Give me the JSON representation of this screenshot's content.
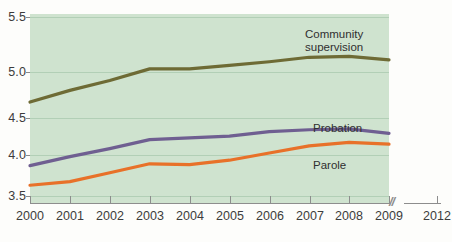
{
  "chart_data": {
    "type": "line",
    "title": "",
    "subtitle": "",
    "xlabel": "",
    "ylabel": "",
    "x": [
      2000,
      2001,
      2002,
      2003,
      2004,
      2005,
      2006,
      2007,
      2008,
      2009
    ],
    "xtick_labels": [
      "2000",
      "2001",
      "2002",
      "2003",
      "2004",
      "2005",
      "2006",
      "2007",
      "2008",
      "2009",
      "2012"
    ],
    "ytick_labels": [
      "5.5",
      "5.0",
      "4.5",
      "4.0",
      "3.5"
    ],
    "ytick_values": [
      5.5,
      5.0,
      4.5,
      4.0,
      3.5
    ],
    "ylim": [
      3.5,
      5.5
    ],
    "xlim": [
      2000,
      2009
    ],
    "grid": true,
    "legend_position": "inline-annotation",
    "axis_break": {
      "symbol": "//",
      "between": [
        "2009",
        "2012"
      ]
    },
    "series": [
      {
        "name": "Community supervision",
        "color": "#6e6b35",
        "label_text": "Community\nsupervision",
        "values": [
          4.55,
          4.68,
          4.79,
          4.92,
          4.92,
          4.96,
          5.0,
          5.05,
          5.06,
          5.02
        ]
      },
      {
        "name": "Probation",
        "color": "#6f5f91",
        "label_text": "Probation",
        "values": [
          3.84,
          3.94,
          4.03,
          4.13,
          4.15,
          4.17,
          4.22,
          4.24,
          4.25,
          4.2
        ]
      },
      {
        "name": "Parole",
        "color": "#e87129",
        "label_text": "Parole",
        "values": [
          3.62,
          3.66,
          3.76,
          3.86,
          3.85,
          3.9,
          3.98,
          4.06,
          4.1,
          4.08
        ]
      }
    ]
  },
  "axes": {
    "y_ticks": [
      {
        "label": "5.5",
        "value": 5.5
      },
      {
        "label": "5.0",
        "value": 5.0
      },
      {
        "label": "4.5",
        "value": 4.5
      },
      {
        "label": "4.0",
        "value": 4.0
      },
      {
        "label": "3.5",
        "value": 3.5
      }
    ],
    "x_ticks": [
      {
        "label": "2000"
      },
      {
        "label": "2001"
      },
      {
        "label": "2002"
      },
      {
        "label": "2003"
      },
      {
        "label": "2004"
      },
      {
        "label": "2005"
      },
      {
        "label": "2006"
      },
      {
        "label": "2007"
      },
      {
        "label": "2008"
      },
      {
        "label": "2009"
      },
      {
        "label": "2012"
      }
    ],
    "break_symbol": "//"
  },
  "annotations": {
    "community_line1": "Community",
    "community_line2": "supervision",
    "probation": "Probation",
    "parole": "Parole"
  },
  "colors": {
    "plot_background": "#cfe3cf",
    "page_background": "#fdfdfb",
    "gridline": "#b2cfb6",
    "axis": "#8d8d8d",
    "text": "#3c3c3c",
    "community_supervision": "#6e6b35",
    "probation": "#6f5f91",
    "parole": "#e87129"
  },
  "top_artifact": {
    "text": "."
  }
}
